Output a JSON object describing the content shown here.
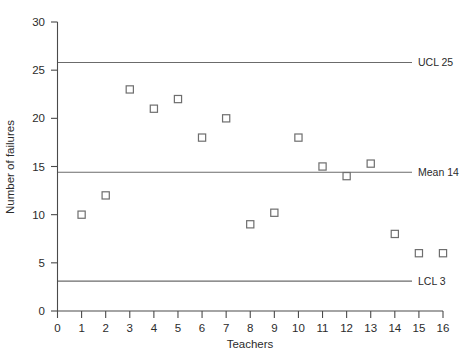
{
  "chart_data": {
    "type": "scatter",
    "title": "",
    "xlabel": "Teachers",
    "ylabel": "Number of failures",
    "xlim": [
      0,
      16
    ],
    "ylim": [
      0,
      30
    ],
    "grid": false,
    "legend": "none",
    "x": [
      1,
      2,
      3,
      4,
      5,
      6,
      7,
      8,
      9,
      10,
      11,
      12,
      13,
      14,
      15,
      16
    ],
    "values": [
      10,
      12,
      23,
      21,
      22,
      18,
      20,
      9,
      10.2,
      18,
      15,
      14,
      15.3,
      8,
      6,
      6
    ],
    "xticks": [
      "0",
      "1",
      "2",
      "3",
      "4",
      "5",
      "6",
      "7",
      "8",
      "9",
      "10",
      "11",
      "12",
      "13",
      "14",
      "15",
      "16"
    ],
    "yticks": [
      "0",
      "5",
      "10",
      "15",
      "20",
      "25",
      "30"
    ],
    "control_lines": [
      {
        "name": "ucl",
        "label": "UCL 25",
        "value": 25.8
      },
      {
        "name": "mean",
        "label": "Mean 14",
        "value": 14.4
      },
      {
        "name": "lcl",
        "label": "LCL 3",
        "value": 3.1
      }
    ],
    "marker_shape": "square-open",
    "colors": {
      "marker": "#6e6e6e",
      "axis": "#4a4a4a",
      "control_line": "#6b6b6b"
    }
  }
}
